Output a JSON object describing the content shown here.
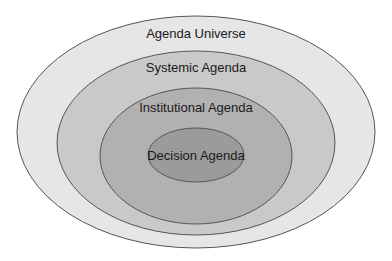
{
  "diagram": {
    "type": "nested-ellipses",
    "levels": [
      {
        "label": "Agenda Universe",
        "fill": "#e6e6e6"
      },
      {
        "label": "Systemic Agenda",
        "fill": "#c8c8c8"
      },
      {
        "label": "Institutional Agenda",
        "fill": "#b0b0b0"
      },
      {
        "label": "Decision Agenda",
        "fill": "#9a9a9a"
      }
    ],
    "stroke": "#555555"
  }
}
